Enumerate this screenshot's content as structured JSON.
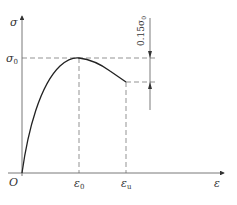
{
  "diagram": {
    "axes": {
      "y_label": "σ",
      "x_label": "ε",
      "origin_label": "O"
    },
    "labels": {
      "peak_stress": "σ",
      "peak_stress_sub": "0",
      "peak_strain": "ε",
      "peak_strain_sub": "0",
      "ultimate_strain": "ε",
      "ultimate_strain_sub": "u",
      "drop_annotation": "0.15σ",
      "drop_annotation_sub": "0"
    },
    "curve": {
      "description": "rising parabola to peak (ε0, σ0), then descending linear-ish branch to (εu, 0.85σ0)",
      "peak": {
        "strain": "ε0",
        "stress": "σ0"
      },
      "end": {
        "strain": "εu",
        "stress_fraction_of_peak": 0.85
      }
    },
    "colors": {
      "line": "#333333",
      "dashed": "#555555"
    }
  }
}
